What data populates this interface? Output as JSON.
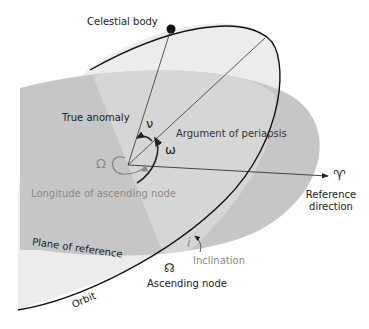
{
  "diagram": {
    "type": "orbital-elements",
    "colors": {
      "plane_of_reference": "#c4c4c4",
      "orbit_plane": "#e9e9e9",
      "overlap": "#d4d4d4",
      "lines": "#222222",
      "grey_text": "#8a8a8a",
      "background": "#ffffff"
    },
    "labels": {
      "celestial_body": "Celestial body",
      "true_anomaly": "True anomaly",
      "argument_of_periapsis": "Argument of periapsis",
      "longitude_of_ascending_node": "Longitude of ascending node",
      "reference_direction_line1": "Reference",
      "reference_direction_line2": "direction",
      "plane_of_reference": "Plane of reference",
      "inclination": "Inclination",
      "ascending_node": "Ascending node",
      "orbit": "Orbit"
    },
    "symbols": {
      "nu": "ν",
      "omega": "ω",
      "capital_omega": "Ω",
      "aries": "♈",
      "inclination": "i",
      "ascending_node_symbol": "☊"
    }
  }
}
